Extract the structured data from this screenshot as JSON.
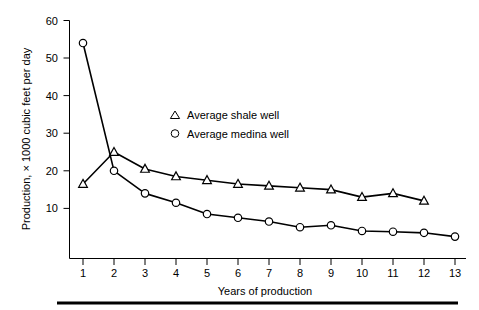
{
  "chart_data": {
    "type": "line",
    "title": "",
    "subtitle": "",
    "xlabel": "Years of production",
    "ylabel": "Production, × 1000 cubic feet per day",
    "x": [
      1,
      2,
      3,
      4,
      5,
      6,
      7,
      8,
      9,
      10,
      11,
      12,
      13
    ],
    "xtick_labels": [
      "1",
      "2",
      "3",
      "4",
      "5",
      "6",
      "7",
      "8",
      "9",
      "10",
      "11",
      "12",
      "13"
    ],
    "ytick_labels": [
      "10",
      "20",
      "30",
      "40",
      "50",
      "60"
    ],
    "yticks": [
      10,
      20,
      30,
      40,
      50,
      60
    ],
    "xlim": [
      0.55,
      13.45
    ],
    "ylim": [
      -3,
      62
    ],
    "grid": false,
    "legend_position": "upper-center-right",
    "series": [
      {
        "name": "Average shale well",
        "marker": "triangle",
        "x": [
          1,
          2,
          3,
          4,
          5,
          6,
          7,
          8,
          9,
          10,
          11,
          12
        ],
        "values": [
          16.5,
          25.0,
          20.5,
          18.5,
          17.5,
          16.5,
          16.0,
          15.5,
          15.0,
          13.0,
          14.0,
          12.0
        ]
      },
      {
        "name": "Average medina well",
        "marker": "circle",
        "x": [
          1,
          2,
          3,
          4,
          5,
          6,
          7,
          8,
          9,
          10,
          11,
          12,
          13
        ],
        "values": [
          54.0,
          20.0,
          14.0,
          11.5,
          8.5,
          7.5,
          6.5,
          5.0,
          5.5,
          4.0,
          3.8,
          3.5,
          2.5
        ]
      }
    ],
    "legend": [
      {
        "label": "Average shale well",
        "marker": "triangle"
      },
      {
        "label": "Average medina well",
        "marker": "circle"
      }
    ],
    "colors": {
      "line": "#000000",
      "marker_fill": "#ffffff",
      "background": "#ffffff",
      "axis": "#000000"
    }
  }
}
